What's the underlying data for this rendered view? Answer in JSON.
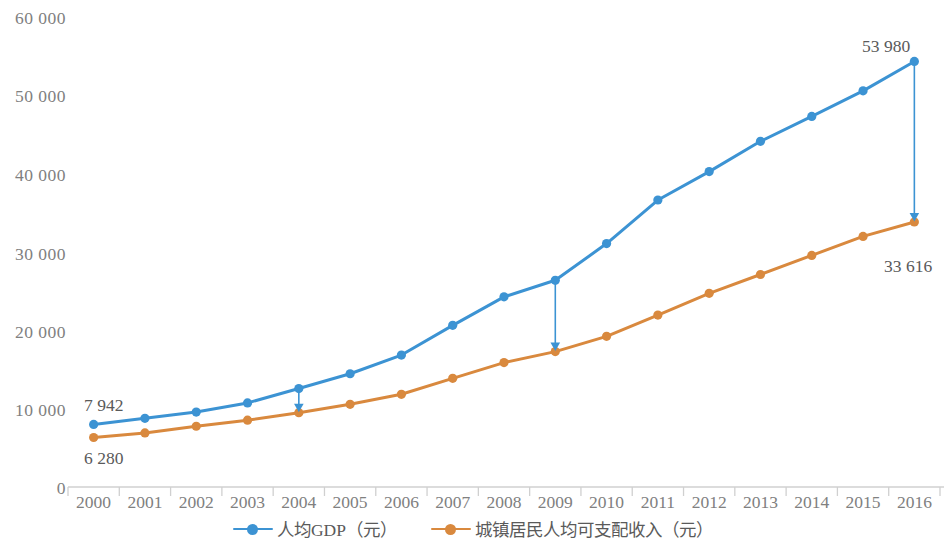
{
  "chart_data": {
    "type": "line",
    "title": "",
    "subtitle": "",
    "xlabel": "",
    "ylabel": "",
    "categories": [
      "2000",
      "2001",
      "2002",
      "2003",
      "2004",
      "2005",
      "2006",
      "2007",
      "2008",
      "2009",
      "2010",
      "2011",
      "2012",
      "2013",
      "2014",
      "2015",
      "2016"
    ],
    "ylim": [
      0,
      60000
    ],
    "yticks": [
      0,
      10000,
      20000,
      30000,
      40000,
      50000,
      60000
    ],
    "ytick_labels": [
      "0",
      "10 000",
      "20 000",
      "30 000",
      "40 000",
      "50 000",
      "60 000"
    ],
    "grid": false,
    "legend_position": "bottom",
    "series": [
      {
        "name": "人均GDP（元）",
        "color": "#3C93D3",
        "values": [
          7942,
          8717,
          9506,
          10666,
          12487,
          14368,
          16738,
          20505,
          24121,
          26222,
          30876,
          36403,
          40007,
          43852,
          47005,
          50251,
          53980
        ]
      },
      {
        "name": "城镇居民人均可支配收入（元）",
        "color": "#D9893E",
        "values": [
          6280,
          6860,
          7703,
          8472,
          9422,
          10493,
          11760,
          13786,
          15781,
          17175,
          19109,
          21810,
          24565,
          26955,
          29381,
          31790,
          33616
        ]
      }
    ],
    "annotations": [
      {
        "name": "first-gdp-value",
        "text": "7 942",
        "x_category": "2000",
        "value": 7942,
        "position": "above-left"
      },
      {
        "name": "first-income-value",
        "text": "6 280",
        "x_category": "2000",
        "value": 6280,
        "position": "below-left"
      },
      {
        "name": "last-gdp-value",
        "text": "53 980",
        "x_category": "2016",
        "value": 53980,
        "position": "above"
      },
      {
        "name": "last-income-value",
        "text": "33 616",
        "x_category": "2016",
        "value": 33616,
        "position": "below-right"
      }
    ],
    "gap_arrows": [
      {
        "name": "gap-arrow-2004",
        "at": "2004",
        "from_series": "人均GDP（元）",
        "to_series": "城镇居民人均可支配收入（元）",
        "color": "#3C93D3"
      },
      {
        "name": "gap-arrow-2009",
        "at": "2009",
        "from_series": "人均GDP（元）",
        "to_series": "城镇居民人均可支配收入（元）",
        "color": "#3C93D3"
      },
      {
        "name": "gap-arrow-2016",
        "at": "2016",
        "from_series": "人均GDP（元）",
        "to_series": "城镇居民人均可支配收入（元）",
        "color": "#3C93D3"
      }
    ]
  },
  "legend": {
    "items": [
      {
        "label": "人均GDP（元）",
        "color": "#3C93D3"
      },
      {
        "label": "城镇居民人均可支配收入（元）",
        "color": "#D9893E"
      }
    ]
  },
  "colors": {
    "gdp_line": "#3C93D3",
    "income_line": "#D9893E",
    "axis": "#D0D0D0",
    "tick_text": "#808080",
    "annotation_text": "#5a5a5a",
    "background": "#ffffff"
  }
}
